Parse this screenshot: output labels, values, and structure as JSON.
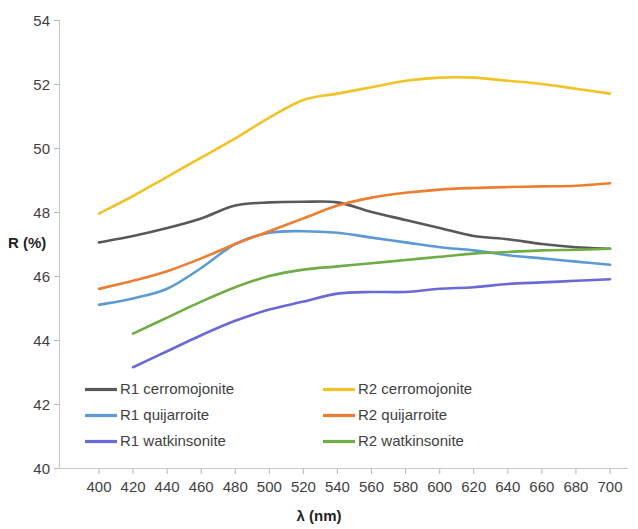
{
  "chart_data": {
    "type": "line",
    "title": "",
    "xlabel": "λ (nm)",
    "ylabel": "R (%)",
    "xlim": [
      390,
      710
    ],
    "ylim": [
      40,
      54
    ],
    "xticks": [
      400,
      420,
      440,
      460,
      480,
      500,
      520,
      540,
      560,
      580,
      600,
      620,
      640,
      660,
      680,
      700
    ],
    "yticks": [
      40,
      42,
      44,
      46,
      48,
      50,
      52,
      54
    ],
    "grid": false,
    "legend_position": "inside-lower-left",
    "series": [
      {
        "name": "R1 cerromojonite",
        "color": "#595959",
        "x": [
          400,
          420,
          440,
          460,
          480,
          500,
          520,
          540,
          560,
          580,
          600,
          620,
          640,
          660,
          680,
          700
        ],
        "values": [
          47.05,
          47.25,
          47.5,
          47.8,
          48.2,
          48.3,
          48.32,
          48.3,
          48.0,
          47.75,
          47.5,
          47.25,
          47.15,
          47.0,
          46.9,
          46.85
        ]
      },
      {
        "name": "R1 quijarroite",
        "color": "#5B9BD5",
        "x": [
          400,
          420,
          440,
          460,
          480,
          500,
          520,
          540,
          560,
          580,
          600,
          620,
          640,
          660,
          680,
          700
        ],
        "values": [
          45.1,
          45.3,
          45.6,
          46.25,
          47.0,
          47.35,
          47.4,
          47.35,
          47.2,
          47.05,
          46.9,
          46.8,
          46.65,
          46.55,
          46.45,
          46.35
        ]
      },
      {
        "name": "R1 watkinsonite",
        "color": "#6A6AD4",
        "x": [
          420,
          440,
          460,
          480,
          500,
          520,
          540,
          560,
          580,
          600,
          620,
          640,
          660,
          680,
          700
        ],
        "values": [
          43.15,
          43.65,
          44.15,
          44.6,
          44.95,
          45.2,
          45.45,
          45.5,
          45.5,
          45.6,
          45.65,
          45.75,
          45.8,
          45.85,
          45.9
        ]
      },
      {
        "name": "R2 cerromojonite",
        "color": "#F2C327",
        "x": [
          400,
          420,
          440,
          460,
          480,
          500,
          520,
          540,
          560,
          580,
          600,
          620,
          640,
          660,
          680,
          700
        ],
        "values": [
          47.95,
          48.5,
          49.1,
          49.7,
          50.3,
          50.95,
          51.5,
          51.7,
          51.9,
          52.1,
          52.2,
          52.2,
          52.1,
          52.0,
          51.85,
          51.7
        ]
      },
      {
        "name": "R2 quijarroite",
        "color": "#ED7D31",
        "x": [
          400,
          420,
          440,
          460,
          480,
          500,
          520,
          540,
          560,
          580,
          600,
          620,
          640,
          660,
          680,
          700
        ],
        "values": [
          45.6,
          45.85,
          46.15,
          46.55,
          47.0,
          47.4,
          47.8,
          48.2,
          48.45,
          48.6,
          48.7,
          48.75,
          48.78,
          48.8,
          48.82,
          48.9
        ]
      },
      {
        "name": "R2 watkinsonite",
        "color": "#70AD47",
        "x": [
          420,
          440,
          460,
          480,
          500,
          520,
          540,
          560,
          580,
          600,
          620,
          640,
          660,
          680,
          700
        ],
        "values": [
          44.2,
          44.7,
          45.2,
          45.65,
          46.0,
          46.2,
          46.3,
          46.4,
          46.5,
          46.6,
          46.7,
          46.75,
          46.8,
          46.82,
          46.85
        ]
      }
    ]
  },
  "axis": {
    "y_title": "R (%)",
    "x_title": "λ (nm)",
    "y_tick_labels": [
      "54",
      "52",
      "50",
      "48",
      "46",
      "44",
      "42",
      "40"
    ],
    "x_tick_labels": [
      "400",
      "420",
      "440",
      "460",
      "480",
      "500",
      "520",
      "540",
      "560",
      "580",
      "600",
      "620",
      "640",
      "660",
      "680",
      "700"
    ]
  },
  "legend": {
    "entries": [
      {
        "label": "R1 cerromojonite",
        "color": "#595959"
      },
      {
        "label": "R2 cerromojonite",
        "color": "#F2C327"
      },
      {
        "label": "R1 quijarroite",
        "color": "#5B9BD5"
      },
      {
        "label": "R2 quijarroite",
        "color": "#ED7D31"
      },
      {
        "label": "R1 watkinsonite",
        "color": "#6A6AD4"
      },
      {
        "label": "R2 watkinsonite",
        "color": "#70AD47"
      }
    ]
  }
}
